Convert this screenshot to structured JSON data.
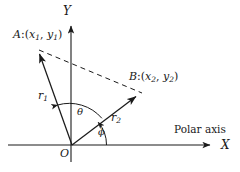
{
  "figure": {
    "background_color": "#ffffff",
    "stroke_color": "#1a1a1a",
    "width": 240,
    "height": 172
  },
  "axes": {
    "x_label": "X",
    "y_label": "Y",
    "origin_label": "O",
    "polar_axis_label": "Polar axis"
  },
  "points": {
    "a": {
      "name": "A",
      "separator": ":(",
      "coord_x_base": "x",
      "coord_x_sub": "1",
      "comma": ", ",
      "coord_y_base": "y",
      "coord_y_sub": "1",
      "close": ")"
    },
    "b": {
      "name": "B",
      "separator": ":(",
      "coord_x_base": "x",
      "coord_x_sub": "2",
      "comma": ", ",
      "coord_y_base": "y",
      "coord_y_sub": "2",
      "close": ")"
    }
  },
  "vectors": {
    "r1": {
      "base": "r",
      "sub": "1"
    },
    "r2": {
      "base": "r",
      "sub": "2"
    }
  },
  "angles": {
    "theta": "θ",
    "phi": "ϕ"
  },
  "geometry": {
    "origin": [
      72,
      145
    ],
    "a_tip": [
      38,
      50
    ],
    "b_tip": [
      140,
      92
    ],
    "x_axis_end": [
      214,
      145
    ],
    "y_axis_top": [
      71,
      21
    ]
  }
}
